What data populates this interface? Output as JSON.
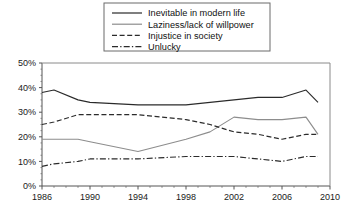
{
  "chart_data": {
    "type": "line",
    "title": "",
    "subtitle": "",
    "xlabel": "",
    "ylabel": "",
    "xlim": [
      1986,
      2010
    ],
    "ylim": [
      0,
      50
    ],
    "grid": false,
    "legend_position": "top-center",
    "x_tick_labels": [
      "1986",
      "1990",
      "1994",
      "1998",
      "2002",
      "2006",
      "2010"
    ],
    "x_ticks": [
      1986,
      1990,
      1994,
      1998,
      2002,
      2006,
      2010
    ],
    "y_tick_labels": [
      "0%",
      "10%",
      "20%",
      "30%",
      "40%",
      "50%"
    ],
    "y_ticks": [
      0,
      10,
      20,
      30,
      40,
      50
    ],
    "x": [
      1986,
      1987,
      1989,
      1990,
      1994,
      1998,
      2000,
      2002,
      2004,
      2006,
      2008,
      2009
    ],
    "series": [
      {
        "name": "Inevitable in modern life",
        "style": "solid",
        "color": "#2b2b2b",
        "values": [
          38,
          39,
          35,
          34,
          33,
          33,
          34,
          35,
          36,
          36,
          39,
          34
        ]
      },
      {
        "name": "Laziness/lack of willpower",
        "style": "solid",
        "color": "#8d8d8d",
        "values": [
          19,
          19,
          19,
          18,
          14,
          19,
          22,
          28,
          27,
          27,
          28,
          21
        ]
      },
      {
        "name": "Injustice in society",
        "style": "dashed",
        "color": "#2b2b2b",
        "values": [
          25,
          26,
          29,
          29,
          29,
          27,
          25,
          22,
          21,
          19,
          21,
          21
        ]
      },
      {
        "name": "Unlucky",
        "style": "dashdot",
        "color": "#2b2b2b",
        "values": [
          8,
          9,
          10,
          11,
          11,
          12,
          12,
          12,
          11,
          10,
          12,
          12
        ]
      }
    ]
  },
  "legend": {
    "items": [
      {
        "label": "Inevitable in modern life"
      },
      {
        "label": "Laziness/lack of willpower"
      },
      {
        "label": "Injustice in society"
      },
      {
        "label": "Unlucky"
      }
    ]
  },
  "axes": {
    "y_labels": [
      "50%",
      "40%",
      "30%",
      "20%",
      "10%",
      "0%"
    ],
    "x_labels": [
      "1986",
      "1990",
      "1994",
      "1998",
      "2002",
      "2006",
      "2010"
    ]
  },
  "colors": {
    "series_dark": "#2b2b2b",
    "series_gray": "#8d8d8d",
    "axis": "#555555",
    "legend_border": "#6b6b6b",
    "background": "#ffffff"
  }
}
